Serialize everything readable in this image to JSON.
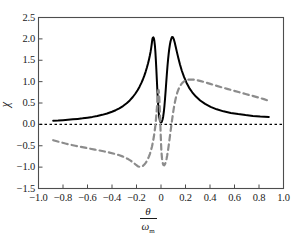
{
  "chart_data": {
    "type": "line",
    "title": "",
    "subtitle": "",
    "xlabel": "θ/ωₘ",
    "xlabel_numerator": "θ",
    "xlabel_denominator": "ω",
    "xlabel_denominator_sub": "m",
    "ylabel": "χ",
    "xlim": [
      -1.0,
      1.0
    ],
    "ylim": [
      -1.5,
      2.5
    ],
    "xticks": [
      -1.0,
      -0.8,
      -0.6,
      -0.4,
      -0.2,
      0,
      0.2,
      0.4,
      0.6,
      0.8,
      1.0
    ],
    "xtick_labels": [
      "-1.0",
      "-0.8",
      "-0.6",
      "-0.4",
      "-0.2",
      "0",
      "0.2",
      "0.4",
      "0.6",
      "0.8",
      "1.0"
    ],
    "yticks": [
      -1.5,
      -1.0,
      -0.5,
      0.0,
      0.5,
      1.0,
      1.5,
      2.0,
      2.5
    ],
    "ytick_labels": [
      "-1.5",
      "-1.0",
      "-0.5",
      "0.0",
      "0.5",
      "1.0",
      "1.5",
      "2.0",
      "2.5"
    ],
    "grid": false,
    "legend": null,
    "legend_position": "none",
    "annotations": [],
    "zero_line": {
      "y": 0.0,
      "style": "dotted",
      "color": "#000000"
    },
    "series": [
      {
        "name": "absorption",
        "style": "solid",
        "color": "#000000",
        "width": 2.0,
        "points": [
          [
            -0.88,
            0.085
          ],
          [
            -0.84,
            0.09
          ],
          [
            -0.8,
            0.098
          ],
          [
            -0.76,
            0.107
          ],
          [
            -0.72,
            0.117
          ],
          [
            -0.68,
            0.128
          ],
          [
            -0.64,
            0.141
          ],
          [
            -0.6,
            0.157
          ],
          [
            -0.56,
            0.175
          ],
          [
            -0.52,
            0.197
          ],
          [
            -0.48,
            0.223
          ],
          [
            -0.44,
            0.255
          ],
          [
            -0.4,
            0.295
          ],
          [
            -0.37,
            0.331
          ],
          [
            -0.34,
            0.374
          ],
          [
            -0.31,
            0.428
          ],
          [
            -0.28,
            0.494
          ],
          [
            -0.255,
            0.56
          ],
          [
            -0.23,
            0.64
          ],
          [
            -0.21,
            0.716
          ],
          [
            -0.19,
            0.805
          ],
          [
            -0.175,
            0.882
          ],
          [
            -0.16,
            0.97
          ],
          [
            -0.148,
            1.05
          ],
          [
            -0.136,
            1.14
          ],
          [
            -0.125,
            1.235
          ],
          [
            -0.115,
            1.33
          ],
          [
            -0.106,
            1.425
          ],
          [
            -0.098,
            1.52
          ],
          [
            -0.091,
            1.61
          ],
          [
            -0.085,
            1.7
          ],
          [
            -0.08,
            1.79
          ],
          [
            -0.076,
            1.87
          ],
          [
            -0.073,
            1.94
          ],
          [
            -0.07,
            2.0
          ],
          [
            -0.066,
            2.03
          ],
          [
            -0.062,
            2.035
          ],
          [
            -0.058,
            2.01
          ],
          [
            -0.054,
            1.95
          ],
          [
            -0.05,
            1.85
          ],
          [
            -0.046,
            1.7
          ],
          [
            -0.042,
            1.51
          ],
          [
            -0.038,
            1.29
          ],
          [
            -0.034,
            1.05
          ],
          [
            -0.03,
            0.81
          ],
          [
            -0.026,
            0.59
          ],
          [
            -0.022,
            0.405
          ],
          [
            -0.018,
            0.265
          ],
          [
            -0.014,
            0.165
          ],
          [
            -0.01,
            0.1
          ],
          [
            -0.006,
            0.065
          ],
          [
            -0.003,
            0.05
          ],
          [
            0.0,
            0.046
          ],
          [
            0.004,
            0.052
          ],
          [
            0.008,
            0.072
          ],
          [
            0.013,
            0.115
          ],
          [
            0.018,
            0.185
          ],
          [
            0.023,
            0.29
          ],
          [
            0.028,
            0.43
          ],
          [
            0.033,
            0.6
          ],
          [
            0.038,
            0.79
          ],
          [
            0.043,
            0.99
          ],
          [
            0.048,
            1.185
          ],
          [
            0.053,
            1.365
          ],
          [
            0.058,
            1.525
          ],
          [
            0.063,
            1.66
          ],
          [
            0.068,
            1.775
          ],
          [
            0.073,
            1.87
          ],
          [
            0.078,
            1.945
          ],
          [
            0.084,
            2.005
          ],
          [
            0.09,
            2.045
          ],
          [
            0.097,
            2.04
          ],
          [
            0.104,
            1.995
          ],
          [
            0.112,
            1.915
          ],
          [
            0.12,
            1.815
          ],
          [
            0.13,
            1.69
          ],
          [
            0.142,
            1.545
          ],
          [
            0.155,
            1.4
          ],
          [
            0.17,
            1.255
          ],
          [
            0.188,
            1.11
          ],
          [
            0.208,
            0.975
          ],
          [
            0.23,
            0.855
          ],
          [
            0.255,
            0.75
          ],
          [
            0.285,
            0.65
          ],
          [
            0.32,
            0.558
          ],
          [
            0.36,
            0.478
          ],
          [
            0.405,
            0.41
          ],
          [
            0.455,
            0.352
          ],
          [
            0.51,
            0.305
          ],
          [
            0.57,
            0.268
          ],
          [
            0.63,
            0.24
          ],
          [
            0.69,
            0.217
          ],
          [
            0.75,
            0.198
          ],
          [
            0.81,
            0.183
          ],
          [
            0.88,
            0.172
          ]
        ]
      },
      {
        "name": "dispersion",
        "style": "dashed",
        "color": "#8c8c8c",
        "width": 2.2,
        "points": [
          [
            -0.88,
            -0.37
          ],
          [
            -0.85,
            -0.395
          ],
          [
            -0.82,
            -0.418
          ],
          [
            -0.78,
            -0.448
          ],
          [
            -0.74,
            -0.475
          ],
          [
            -0.7,
            -0.5
          ],
          [
            -0.66,
            -0.523
          ],
          [
            -0.62,
            -0.545
          ],
          [
            -0.58,
            -0.568
          ],
          [
            -0.54,
            -0.59
          ],
          [
            -0.5,
            -0.612
          ],
          [
            -0.46,
            -0.635
          ],
          [
            -0.42,
            -0.66
          ],
          [
            -0.38,
            -0.688
          ],
          [
            -0.345,
            -0.718
          ],
          [
            -0.315,
            -0.748
          ],
          [
            -0.29,
            -0.78
          ],
          [
            -0.268,
            -0.812
          ],
          [
            -0.248,
            -0.848
          ],
          [
            -0.23,
            -0.885
          ],
          [
            -0.215,
            -0.92
          ],
          [
            -0.203,
            -0.95
          ],
          [
            -0.193,
            -0.972
          ],
          [
            -0.184,
            -0.985
          ],
          [
            -0.176,
            -0.992
          ],
          [
            -0.168,
            -0.993
          ],
          [
            -0.16,
            -0.988
          ],
          [
            -0.152,
            -0.978
          ],
          [
            -0.144,
            -0.962
          ],
          [
            -0.136,
            -0.94
          ],
          [
            -0.128,
            -0.912
          ],
          [
            -0.12,
            -0.878
          ],
          [
            -0.112,
            -0.838
          ],
          [
            -0.105,
            -0.795
          ],
          [
            -0.098,
            -0.748
          ],
          [
            -0.091,
            -0.695
          ],
          [
            -0.085,
            -0.64
          ],
          [
            -0.079,
            -0.578
          ],
          [
            -0.073,
            -0.51
          ],
          [
            -0.068,
            -0.44
          ],
          [
            -0.063,
            -0.365
          ],
          [
            -0.058,
            -0.285
          ],
          [
            -0.054,
            -0.205
          ],
          [
            -0.05,
            -0.12
          ],
          [
            -0.046,
            -0.03
          ],
          [
            -0.043,
            0.06
          ],
          [
            -0.04,
            0.155
          ],
          [
            -0.037,
            0.255
          ],
          [
            -0.034,
            0.355
          ],
          [
            -0.032,
            0.45
          ],
          [
            -0.03,
            0.545
          ],
          [
            -0.028,
            0.635
          ],
          [
            -0.026,
            0.712
          ],
          [
            -0.024,
            0.768
          ],
          [
            -0.022,
            0.8
          ],
          [
            -0.02,
            0.805
          ],
          [
            -0.018,
            0.78
          ],
          [
            -0.016,
            0.72
          ],
          [
            -0.014,
            0.63
          ],
          [
            -0.012,
            0.51
          ],
          [
            -0.01,
            0.37
          ],
          [
            -0.008,
            0.215
          ],
          [
            -0.006,
            0.055
          ],
          [
            -0.004,
            -0.11
          ],
          [
            -0.002,
            -0.27
          ],
          [
            0.0,
            -0.42
          ],
          [
            0.002,
            -0.56
          ],
          [
            0.005,
            -0.69
          ],
          [
            0.008,
            -0.79
          ],
          [
            0.012,
            -0.872
          ],
          [
            0.016,
            -0.925
          ],
          [
            0.02,
            -0.952
          ],
          [
            0.025,
            -0.958
          ],
          [
            0.03,
            -0.945
          ],
          [
            0.035,
            -0.915
          ],
          [
            0.04,
            -0.868
          ],
          [
            0.045,
            -0.808
          ],
          [
            0.05,
            -0.735
          ],
          [
            0.055,
            -0.65
          ],
          [
            0.06,
            -0.555
          ],
          [
            0.065,
            -0.45
          ],
          [
            0.07,
            -0.34
          ],
          [
            0.075,
            -0.228
          ],
          [
            0.08,
            -0.115
          ],
          [
            0.086,
            0.01
          ],
          [
            0.092,
            0.135
          ],
          [
            0.098,
            0.258
          ],
          [
            0.105,
            0.385
          ],
          [
            0.113,
            0.51
          ],
          [
            0.122,
            0.628
          ],
          [
            0.132,
            0.735
          ],
          [
            0.144,
            0.83
          ],
          [
            0.158,
            0.91
          ],
          [
            0.174,
            0.972
          ],
          [
            0.192,
            1.015
          ],
          [
            0.212,
            1.04
          ],
          [
            0.235,
            1.05
          ],
          [
            0.262,
            1.048
          ],
          [
            0.292,
            1.035
          ],
          [
            0.325,
            1.012
          ],
          [
            0.362,
            0.982
          ],
          [
            0.402,
            0.948
          ],
          [
            0.445,
            0.91
          ],
          [
            0.492,
            0.87
          ],
          [
            0.54,
            0.83
          ],
          [
            0.59,
            0.79
          ],
          [
            0.64,
            0.75
          ],
          [
            0.69,
            0.71
          ],
          [
            0.74,
            0.672
          ],
          [
            0.79,
            0.632
          ],
          [
            0.84,
            0.59
          ],
          [
            0.88,
            0.552
          ]
        ]
      }
    ]
  },
  "axes": {
    "frame_color": "#4d4d4d",
    "tick_color": "#4d4d4d"
  }
}
